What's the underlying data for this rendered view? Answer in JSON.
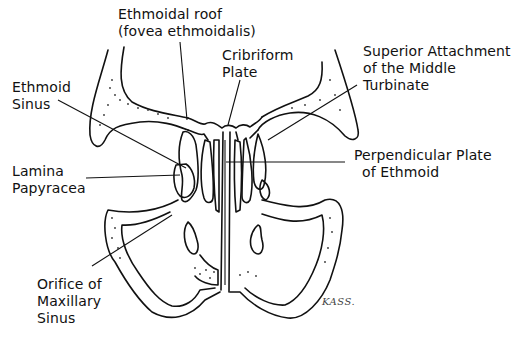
{
  "diagram": {
    "labels": [
      {
        "id": "ethmoidal-roof",
        "lines": [
          "Ethmoidal roof",
          "(fovea ethmoidalis)"
        ]
      },
      {
        "id": "cribriform-plate",
        "lines": [
          "Cribriform",
          "Plate"
        ]
      },
      {
        "id": "superior-attachment",
        "lines": [
          "Superior Attachment",
          "of the Middle",
          "Turbinate"
        ]
      },
      {
        "id": "ethmoid-sinus",
        "lines": [
          "Ethmoid",
          "Sinus"
        ]
      },
      {
        "id": "lamina-papyracea",
        "lines": [
          "Lamina",
          "Papyracea"
        ]
      },
      {
        "id": "perpendicular-plate",
        "lines": [
          "Perpendicular Plate",
          "of Ethmoid"
        ]
      },
      {
        "id": "orifice-maxillary",
        "lines": [
          "Orifice of",
          "Maxillary",
          "Sinus"
        ]
      }
    ],
    "signature": "KASS."
  }
}
